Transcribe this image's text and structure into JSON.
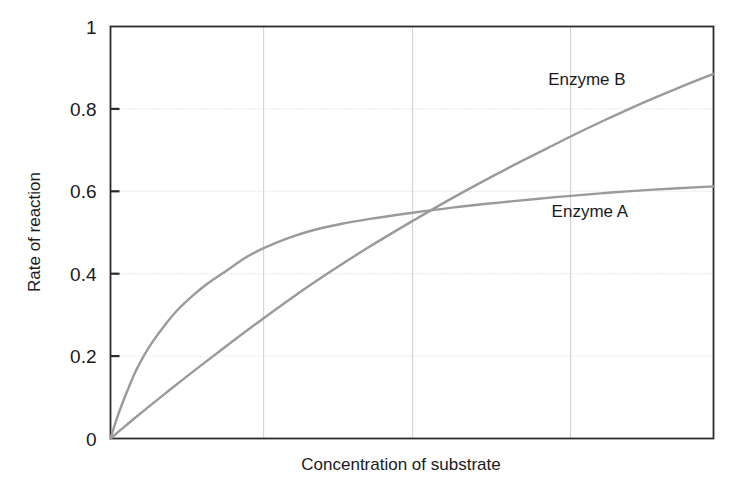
{
  "chart_data": {
    "type": "line",
    "title": "",
    "xlabel": "Concentration of substrate",
    "ylabel": "Rate of reaction",
    "xlim": [
      0,
      1
    ],
    "ylim": [
      0,
      1
    ],
    "grid": true,
    "legend_position": "inline-right",
    "y_ticks": [
      "0",
      "0.2",
      "0.4",
      "0.6",
      "0.8",
      "1"
    ],
    "y_tick_values": [
      0,
      0.2,
      0.4,
      0.6,
      0.8,
      1
    ],
    "x_ticks": [],
    "x_gridlines": [
      0.254,
      0.501,
      0.763
    ],
    "line_color": "#9a9a9a",
    "axis_color": "#2b2b2b",
    "grid_color": "#cfcfcf",
    "series": [
      {
        "name": "Enzyme A",
        "label": "Enzyme A",
        "label_x": 0.795,
        "label_y": 0.553,
        "x": [
          0,
          0.012,
          0.025,
          0.04,
          0.055,
          0.07,
          0.09,
          0.11,
          0.135,
          0.16,
          0.19,
          0.225,
          0.254,
          0.29,
          0.33,
          0.38,
          0.43,
          0.501,
          0.57,
          0.64,
          0.71,
          0.763,
          0.83,
          0.9,
          0.95,
          1.0
        ],
        "values": [
          0,
          0.055,
          0.105,
          0.158,
          0.2,
          0.235,
          0.275,
          0.31,
          0.345,
          0.375,
          0.405,
          0.44,
          0.462,
          0.484,
          0.503,
          0.52,
          0.533,
          0.548,
          0.561,
          0.572,
          0.582,
          0.589,
          0.597,
          0.604,
          0.608,
          0.612
        ]
      },
      {
        "name": "Enzyme B",
        "label": "Enzyme B",
        "label_x": 0.79,
        "label_y": 0.872,
        "x": [
          0,
          0.03,
          0.06,
          0.1,
          0.14,
          0.19,
          0.254,
          0.31,
          0.37,
          0.43,
          0.501,
          0.56,
          0.62,
          0.68,
          0.74,
          0.763,
          0.82,
          0.88,
          0.94,
          1.0
        ],
        "values": [
          0,
          0.037,
          0.073,
          0.12,
          0.166,
          0.222,
          0.292,
          0.351,
          0.41,
          0.466,
          0.528,
          0.578,
          0.626,
          0.672,
          0.716,
          0.733,
          0.773,
          0.813,
          0.85,
          0.885
        ]
      }
    ]
  }
}
